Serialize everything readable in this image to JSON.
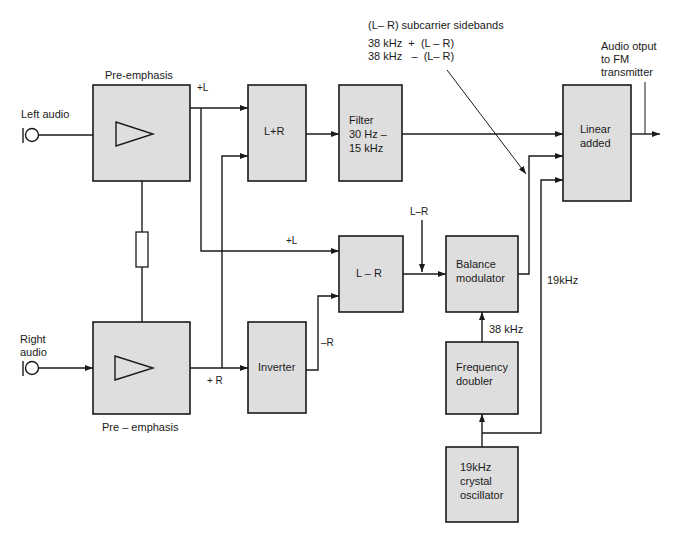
{
  "diagram": {
    "type": "block-diagram",
    "colors": {
      "block_fill": "#dedede",
      "line": "#1a1a1a",
      "background": "#ffffff"
    },
    "inputs": {
      "left": "Left audio",
      "right_line1": "Right",
      "right_line2": "audio"
    },
    "blocks": {
      "preemph_top_label": "Pre-emphasis",
      "preemph_bottom_label": "Pre – emphasis",
      "sum": "L+R",
      "filter_line1": "Filter",
      "filter_line2": "30 Hz –",
      "filter_line3": "15 kHz",
      "linear_line1": "Linear",
      "linear_line2": "added",
      "diff": "L – R",
      "inverter": "Inverter",
      "balance_line1": "Balance",
      "balance_line2": "modulator",
      "doubler_line1": "Frequency",
      "doubler_line2": "doubler",
      "osc_line1": "19kHz",
      "osc_line2": "crystal",
      "osc_line3": "oscillator"
    },
    "signals": {
      "plus_l_top": "+L",
      "plus_l_mid": "+L",
      "plus_r": "+ R",
      "minus_r": "–R",
      "l_minus_r": "L–R",
      "khz38": "38 kHz",
      "khz19": "19kHz"
    },
    "annotations": {
      "sidebands_title": "(L– R) subcarrier sidebands",
      "sideband_upper": "38 kHz  +  (L – R)",
      "sideband_lower": "38 kHz   –  (L– R)",
      "output_line1": "Audio otput",
      "output_line2": "to FM",
      "output_line3": "transmitter"
    }
  }
}
